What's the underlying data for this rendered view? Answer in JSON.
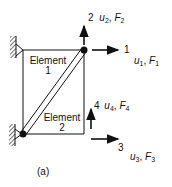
{
  "figure": {
    "caption": "(a)",
    "elements": [
      {
        "name": "Element",
        "number": "1"
      },
      {
        "name": "Element",
        "number": "2"
      }
    ],
    "dofs": [
      {
        "index": "1",
        "disp": "u",
        "force": "F",
        "sub": "1",
        "direction": "right"
      },
      {
        "index": "2",
        "disp": "u",
        "force": "F",
        "sub": "2",
        "direction": "up"
      },
      {
        "index": "3",
        "disp": "u",
        "force": "F",
        "sub": "3",
        "direction": "right"
      },
      {
        "index": "4",
        "disp": "u",
        "force": "F",
        "sub": "4",
        "direction": "up"
      }
    ],
    "sep": ", "
  }
}
